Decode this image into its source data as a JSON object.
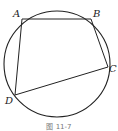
{
  "figure": {
    "caption": "图 11-7",
    "circle": {
      "cx": 57,
      "cy": 64,
      "r": 53,
      "stroke": "#222222"
    },
    "points": [
      {
        "name": "A",
        "x": 22,
        "y": 19,
        "label_x": 14,
        "label_y": 17
      },
      {
        "name": "B",
        "x": 91,
        "y": 19,
        "label_x": 93,
        "label_y": 17
      },
      {
        "name": "C",
        "x": 108,
        "y": 67,
        "label_x": 110,
        "label_y": 71
      },
      {
        "name": "D",
        "x": 15,
        "y": 95,
        "label_x": 5,
        "label_y": 104
      }
    ],
    "segments": [
      [
        "A",
        "B"
      ],
      [
        "B",
        "C"
      ],
      [
        "C",
        "D"
      ],
      [
        "D",
        "A"
      ]
    ]
  }
}
